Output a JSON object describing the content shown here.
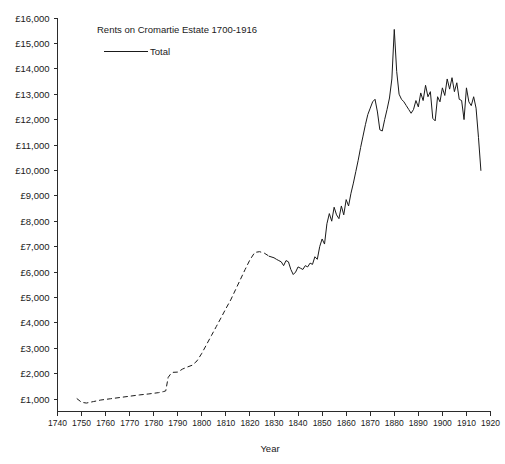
{
  "chart_data": {
    "type": "line",
    "title": "Rents on Cromartie Estate 1700-1916",
    "xlabel": "Year",
    "ylabel": "",
    "xlim": [
      1740,
      1920
    ],
    "ylim": [
      0,
      16000
    ],
    "grid": false,
    "legend_position": "top-left-inside",
    "legend": [
      "Total"
    ],
    "currency_symbol": "£",
    "y_ticks": [
      1000,
      2000,
      3000,
      4000,
      5000,
      6000,
      7000,
      8000,
      9000,
      10000,
      11000,
      12000,
      13000,
      14000,
      15000,
      16000
    ],
    "y_tick_labels": [
      "£1,000",
      "£2,000",
      "£3,000",
      "£4,000",
      "£5,000",
      "£6,000",
      "£7,000",
      "£8,000",
      "£9,000",
      "£10,000",
      "£11,000",
      "£12,000",
      "£13,000",
      "£14,000",
      "£15,000",
      "£16,000"
    ],
    "x_ticks": [
      1740,
      1750,
      1760,
      1770,
      1780,
      1790,
      1800,
      1810,
      1820,
      1830,
      1840,
      1850,
      1860,
      1870,
      1880,
      1890,
      1900,
      1910,
      1920
    ],
    "x_tick_labels": [
      "1740",
      "1750",
      "1760",
      "1770",
      "1780",
      "1790",
      "1800",
      "1810",
      "1820",
      "1830",
      "1840",
      "1850",
      "1860",
      "1870",
      "1880",
      "1890",
      "1900",
      "1910",
      "1920"
    ],
    "series": [
      {
        "name": "Total",
        "style": "mixed",
        "dashed_segment": {
          "note": "interpolated / estimated values drawn as dashed line",
          "x": [
            1748,
            1750,
            1752,
            1755,
            1758,
            1762,
            1766,
            1770,
            1774,
            1778,
            1782,
            1784,
            1785,
            1786,
            1787,
            1788,
            1790,
            1792,
            1794,
            1796,
            1798,
            1800,
            1802,
            1804,
            1806,
            1808,
            1810,
            1812,
            1814,
            1816,
            1818,
            1820,
            1822,
            1824,
            1826,
            1828
          ],
          "y": [
            1020,
            870,
            840,
            900,
            960,
            1010,
            1060,
            1110,
            1160,
            1200,
            1250,
            1290,
            1320,
            1850,
            1980,
            2050,
            2060,
            2180,
            2260,
            2330,
            2500,
            2800,
            3150,
            3500,
            3850,
            4200,
            4560,
            4900,
            5300,
            5700,
            6100,
            6480,
            6770,
            6800,
            6740,
            6620
          ]
        },
        "solid_segment": {
          "note": "recorded annual rent totals drawn as solid line",
          "x": [
            1828,
            1830,
            1831,
            1832,
            1833,
            1834,
            1835,
            1836,
            1837,
            1838,
            1839,
            1840,
            1841,
            1842,
            1843,
            1844,
            1845,
            1846,
            1847,
            1848,
            1849,
            1850,
            1851,
            1852,
            1853,
            1854,
            1855,
            1856,
            1857,
            1858,
            1859,
            1860,
            1861,
            1862,
            1863,
            1864,
            1865,
            1866,
            1867,
            1868,
            1869,
            1870,
            1871,
            1872,
            1873,
            1874,
            1875,
            1876,
            1877,
            1878,
            1879,
            1880,
            1881,
            1882,
            1883,
            1884,
            1885,
            1886,
            1887,
            1888,
            1889,
            1890,
            1891,
            1892,
            1893,
            1894,
            1895,
            1896,
            1897,
            1898,
            1899,
            1900,
            1901,
            1902,
            1903,
            1904,
            1905,
            1906,
            1907,
            1908,
            1909,
            1910,
            1911,
            1912,
            1913,
            1914,
            1915,
            1916
          ],
          "y": [
            6620,
            6560,
            6500,
            6450,
            6400,
            6250,
            6450,
            6400,
            6100,
            5900,
            6000,
            6200,
            6150,
            6100,
            6250,
            6200,
            6350,
            6300,
            6600,
            6500,
            7000,
            7300,
            7100,
            7900,
            8300,
            8000,
            8550,
            8250,
            8100,
            8600,
            8250,
            8850,
            8600,
            9100,
            9500,
            9950,
            10400,
            10900,
            11350,
            11800,
            12200,
            12450,
            12700,
            12800,
            12300,
            11600,
            11550,
            12000,
            12400,
            12850,
            13600,
            15550,
            13900,
            13000,
            12800,
            12700,
            12550,
            12400,
            12250,
            12400,
            12750,
            12500,
            13050,
            12750,
            13350,
            12900,
            13100,
            12050,
            11950,
            12900,
            12700,
            13250,
            12950,
            13600,
            13200,
            13650,
            13100,
            13450,
            12800,
            12750,
            12000,
            13250,
            12700,
            12550,
            12900,
            12450,
            11300,
            10000
          ]
        }
      }
    ]
  },
  "title_block": {
    "title": "Rents on Cromartie Estate 1700-1916"
  },
  "legend_block": {
    "items": [
      {
        "label": "Total"
      }
    ]
  },
  "axes": {
    "x_axis_title": "Year",
    "y_axis_title": ""
  }
}
